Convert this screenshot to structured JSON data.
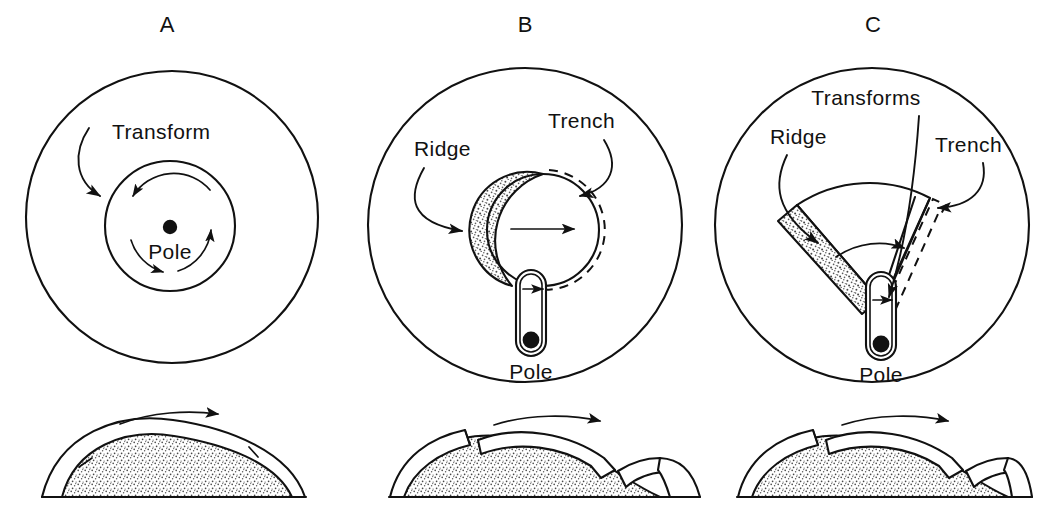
{
  "figure": {
    "title_panels": [
      "A",
      "B",
      "C"
    ],
    "background_color": "#ffffff",
    "ink_color": "#111111",
    "stipple_color": "#6b6b6b"
  },
  "panels": [
    {
      "id": "A",
      "letter": "A",
      "labels": {
        "transform": "Transform",
        "pole": "Pole"
      },
      "elements": [
        "outer-circle",
        "inner-small-circle",
        "pole-dot",
        "rotation-arc-arrow-upper",
        "rotation-arc-arrow-lower",
        "transform-leader-arrow"
      ]
    },
    {
      "id": "B",
      "letter": "B",
      "labels": {
        "ridge": "Ridge",
        "trench": "Trench",
        "pole": "Pole"
      },
      "elements": [
        "outer-circle",
        "plate-circle",
        "stippled-ridge-crescent",
        "dashed-trench-arc",
        "motion-arrow",
        "transform-corridor",
        "corridor-motion-arrow",
        "pole-dot",
        "ridge-leader-arrow",
        "trench-leader-arrow"
      ]
    },
    {
      "id": "C",
      "letter": "C",
      "labels": {
        "ridge": "Ridge",
        "transforms": "Transforms",
        "trench": "Trench",
        "pole": "Pole"
      },
      "elements": [
        "outer-circle",
        "plate-wedge",
        "stippled-ridge-strip",
        "dashed-trench-outline",
        "transform-radial-lines",
        "motion-arrow",
        "transform-corridor",
        "corridor-motion-arrow",
        "pole-dot",
        "ridge-leader-arrow",
        "transforms-leader-line",
        "trench-leader-arrow"
      ]
    }
  ],
  "cross_sections": [
    {
      "id": "A",
      "description": "dome with continuous lithosphere shell over stippled mantle, two radial breaks",
      "elements": [
        "mantle-dome-stippled",
        "lithosphere-shell",
        "break-line-left",
        "break-line-right",
        "baseline",
        "motion-arrow"
      ]
    },
    {
      "id": "B",
      "description": "dome with detached plate riding over mantle, ridge gap left and subduction step right",
      "elements": [
        "mantle-dome-stippled",
        "left-plate-segment",
        "riding-plate",
        "right-plate-segment",
        "subducting-slab",
        "baseline",
        "motion-arrow"
      ]
    },
    {
      "id": "C",
      "description": "dome with detached plate riding over mantle, ridge gap left and subduction step right",
      "elements": [
        "mantle-dome-stippled",
        "left-plate-segment",
        "riding-plate",
        "right-plate-segment",
        "subducting-slab",
        "baseline",
        "motion-arrow"
      ]
    }
  ]
}
